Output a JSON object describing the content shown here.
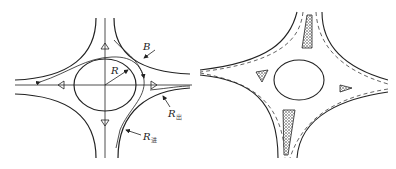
{
  "figure": {
    "left_panel": {
      "title": "Roundabout geometry schematic",
      "labels": {
        "B": "B",
        "R": "R",
        "R_exit": "R",
        "R_exit_sub": "出",
        "R_entry": "R",
        "R_entry_sub": "进"
      }
    },
    "right_panel": {
      "title": "Roundabout with channelizing islands"
    },
    "colors": {
      "line": "#222222",
      "hatch": "#555555",
      "background": "#ffffff"
    }
  }
}
